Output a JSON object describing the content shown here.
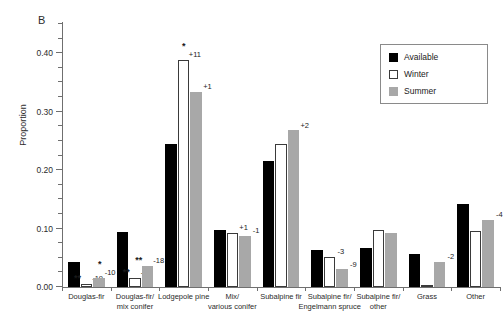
{
  "figure": {
    "panel_letter": "B"
  },
  "legend": {
    "position": "top-right",
    "entries": [
      {
        "label": "Available",
        "key": "available",
        "color": "#000000"
      },
      {
        "label": "Winter",
        "key": "winter",
        "color": "#ffffff"
      },
      {
        "label": "Summer",
        "key": "summer",
        "color": "#a8a8a8"
      }
    ]
  },
  "chart_data": {
    "type": "bar",
    "title": "",
    "subtitle": "",
    "panel": "B",
    "xlabel": "",
    "ylabel": "Proportion",
    "ylim": [
      0.0,
      0.45
    ],
    "ytick_labels": [
      "0.00",
      "0.10",
      "0.20",
      "0.30",
      "0.40"
    ],
    "ytick_values": [
      0.0,
      0.1,
      0.2,
      0.3,
      0.4
    ],
    "yminor_step": 0.025,
    "grid": false,
    "categories": [
      "Douglas-fir",
      "Douglas-fir/\nmix conifer",
      "Lodgepole pine",
      "Mix/\nvarious conifer",
      "Subalpine fir",
      "Subalpine fir/\nEngelmann spruce",
      "Subalpine fir/\nother",
      "Grass",
      "Other"
    ],
    "series": [
      {
        "name": "Available",
        "key": "available",
        "color": "#000000",
        "values": [
          0.042,
          0.094,
          0.244,
          0.097,
          0.216,
          0.064,
          0.066,
          0.056,
          0.142
        ]
      },
      {
        "name": "Winter",
        "key": "winter",
        "color": "#ffffff",
        "values": [
          0.006,
          0.016,
          0.389,
          0.093,
          0.245,
          0.052,
          0.098,
          0.002,
          0.096
        ]
      },
      {
        "name": "Summer",
        "key": "summer",
        "color": "#a8a8a8",
        "values": [
          0.016,
          0.036,
          0.334,
          0.088,
          0.268,
          0.03,
          0.093,
          0.043,
          0.115
        ]
      }
    ],
    "annotations": [
      {
        "category": "Douglas-fir",
        "series": "Winter",
        "delta": "-19",
        "significance": "**"
      },
      {
        "category": "Douglas-fir",
        "series": "Summer",
        "delta": "-10",
        "significance": "*"
      },
      {
        "category": "Douglas-fir/\nmix conifer",
        "series": "Winter",
        "delta": "-20",
        "significance": "**"
      },
      {
        "category": "Douglas-fir/\nmix conifer",
        "series": "Summer",
        "delta": "-18",
        "significance": "**"
      },
      {
        "category": "Lodgepole pine",
        "series": "Winter",
        "delta": "+11",
        "significance": "*"
      },
      {
        "category": "Lodgepole pine",
        "series": "Summer",
        "delta": "+1",
        "significance": ""
      },
      {
        "category": "Mix/\nvarious conifer",
        "series": "Winter",
        "delta": "+1",
        "significance": ""
      },
      {
        "category": "Mix/\nvarious conifer",
        "series": "Summer",
        "delta": "-1",
        "significance": ""
      },
      {
        "category": "Subalpine fir",
        "series": "Summer",
        "delta": "+2",
        "significance": ""
      },
      {
        "category": "Subalpine fir/\nEngelmann spruce",
        "series": "Winter",
        "delta": "-3",
        "significance": ""
      },
      {
        "category": "Subalpine fir/\nEngelmann spruce",
        "series": "Summer",
        "delta": "-9",
        "significance": ""
      },
      {
        "category": "Grass",
        "series": "Summer",
        "delta": "-2",
        "significance": ""
      },
      {
        "category": "Other",
        "series": "Summer",
        "delta": "-4",
        "significance": ""
      }
    ]
  }
}
